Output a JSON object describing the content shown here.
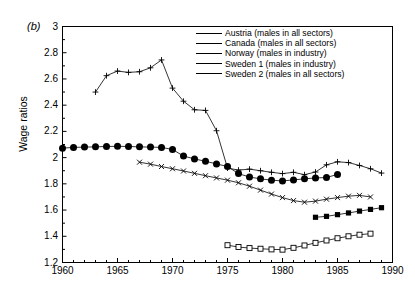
{
  "panel": {
    "label": "(b)"
  },
  "axes": {
    "ylabel": "Wage ratios",
    "yticks": [
      "3",
      "2.8",
      "2.6",
      "2.4",
      "2.2",
      "2",
      "1.8",
      "1.6",
      "1.4",
      "1.2"
    ],
    "xticks": [
      "1960",
      "1965",
      "1970",
      "1975",
      "1980",
      "1985",
      "1990"
    ]
  },
  "legend": {
    "items": [
      {
        "label": "Austria (males in all sectors)",
        "marker": "filled-square-marker",
        "key": "austria"
      },
      {
        "label": "Canada (males in all sectors)",
        "marker": "cross-x-marker",
        "key": "canada"
      },
      {
        "label": "Norway (males in industry)",
        "marker": "plus-marker",
        "key": "norway"
      },
      {
        "label": "Sweden 1 (males in industry)",
        "marker": "filled-circle-marker",
        "key": "sweden1"
      },
      {
        "label": "Sweden 2 (males in all sectors)",
        "marker": "open-square-marker",
        "key": "sweden2"
      }
    ]
  },
  "chart_data": {
    "type": "line",
    "title": "",
    "xlabel": "",
    "ylabel": "Wage ratios",
    "xlim": [
      1960,
      1990
    ],
    "ylim": [
      1.2,
      3
    ],
    "ytick_step": 0.2,
    "xtick_step": 5,
    "xminor_step": 1,
    "grid": false,
    "legend_position": "top-right",
    "line_color": "#000000",
    "series": [
      {
        "name": "Austria (males in all sectors)",
        "marker": "filled-square",
        "x": [
          1983,
          1984,
          1985,
          1986,
          1987,
          1988,
          1989
        ],
        "y": [
          1.545,
          1.552,
          1.565,
          1.578,
          1.592,
          1.605,
          1.618
        ]
      },
      {
        "name": "Canada (males in all sectors)",
        "marker": "cross-x",
        "x": [
          1967,
          1968,
          1969,
          1970,
          1971,
          1972,
          1973,
          1974,
          1975,
          1976,
          1977,
          1978,
          1979,
          1980,
          1981,
          1982,
          1983,
          1984,
          1985,
          1986,
          1987,
          1988
        ],
        "y": [
          1.965,
          1.95,
          1.932,
          1.915,
          1.898,
          1.88,
          1.862,
          1.845,
          1.828,
          1.808,
          1.782,
          1.752,
          1.722,
          1.695,
          1.672,
          1.66,
          1.668,
          1.683,
          1.695,
          1.706,
          1.712,
          1.7
        ]
      },
      {
        "name": "Norway (males in industry)",
        "marker": "plus",
        "x": [
          1963,
          1964,
          1965,
          1966,
          1967,
          1968,
          1969,
          1970,
          1971,
          1972,
          1973,
          1974,
          1975,
          1976,
          1977,
          1978,
          1979,
          1980,
          1981,
          1982,
          1983,
          1984,
          1985,
          1986,
          1987,
          1988,
          1989
        ],
        "y": [
          2.5,
          2.625,
          2.66,
          2.65,
          2.655,
          2.685,
          2.745,
          2.53,
          2.43,
          2.365,
          2.36,
          2.205,
          1.92,
          1.905,
          1.912,
          1.9,
          1.888,
          1.878,
          1.888,
          1.87,
          1.89,
          1.945,
          1.968,
          1.962,
          1.94,
          1.915,
          1.882
        ]
      },
      {
        "name": "Sweden 1 (males in industry)",
        "marker": "filled-circle",
        "x": [
          1960,
          1961,
          1962,
          1963,
          1964,
          1965,
          1966,
          1967,
          1968,
          1969,
          1970,
          1971,
          1972,
          1973,
          1974,
          1975,
          1976,
          1977,
          1978,
          1979,
          1980,
          1981,
          1982,
          1983,
          1984,
          1985
        ],
        "y": [
          2.072,
          2.078,
          2.08,
          2.082,
          2.085,
          2.086,
          2.085,
          2.082,
          2.08,
          2.078,
          2.062,
          2.012,
          1.99,
          1.972,
          1.952,
          1.932,
          1.878,
          1.852,
          1.838,
          1.828,
          1.822,
          1.83,
          1.838,
          1.845,
          1.848,
          1.872
        ]
      },
      {
        "name": "Sweden 2 (males in all sectors)",
        "marker": "open-square",
        "x": [
          1975,
          1976,
          1977,
          1978,
          1979,
          1980,
          1981,
          1982,
          1983,
          1984,
          1985,
          1986,
          1987,
          1988
        ],
        "y": [
          1.332,
          1.318,
          1.31,
          1.305,
          1.3,
          1.298,
          1.312,
          1.33,
          1.35,
          1.368,
          1.385,
          1.4,
          1.412,
          1.42
        ]
      }
    ]
  }
}
